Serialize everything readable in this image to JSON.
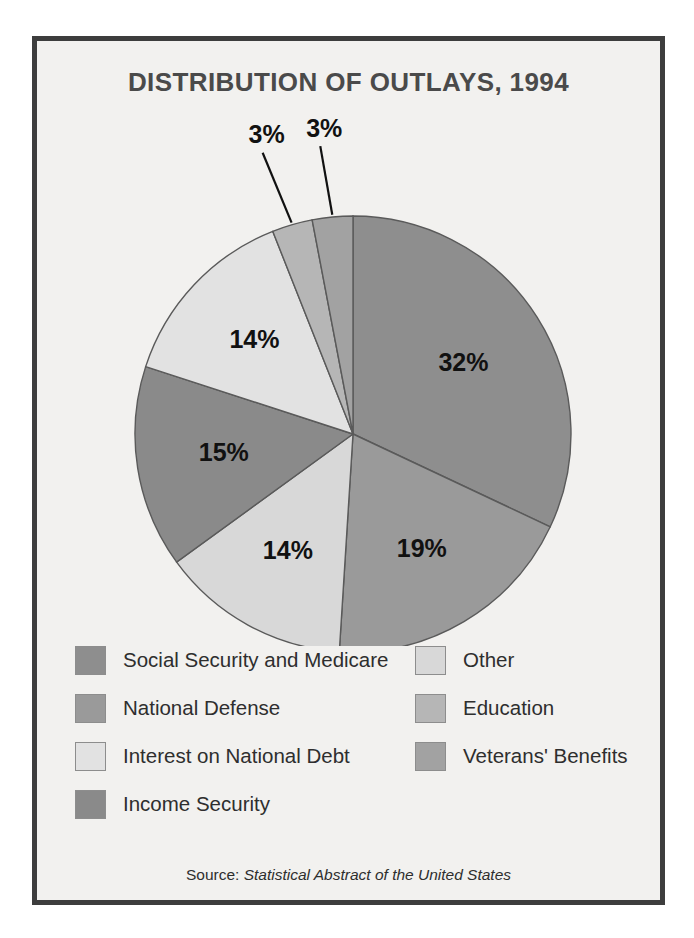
{
  "figure": {
    "title": "DISTRIBUTION OF OUTLAYS, 1994",
    "source_prefix": "Source:",
    "source_publication": "Statistical Abstract of the United States"
  },
  "chart_data": {
    "type": "pie",
    "title": "DISTRIBUTION OF OUTLAYS, 1994",
    "xlabel": "",
    "ylabel": "",
    "units": "percent",
    "total": 100,
    "start_angle_deg": 0,
    "direction": "clockwise",
    "legend_position": "bottom",
    "grid": false,
    "categories": [
      "Social Security and Medicare",
      "National Defense",
      "Other",
      "Income Security",
      "Interest on National Debt",
      "Education",
      "Veterans' Benefits"
    ],
    "values": [
      32,
      19,
      14,
      15,
      14,
      3,
      3
    ],
    "slices": [
      {
        "label": "Social Security and Medicare",
        "value": 32,
        "display": "32%",
        "color": "#8e8e8e",
        "label_radius_frac": 0.6,
        "leader": false
      },
      {
        "label": "National Defense",
        "value": 19,
        "display": "19%",
        "color": "#9a9a9a",
        "label_radius_frac": 0.62,
        "leader": false
      },
      {
        "label": "Other",
        "value": 14,
        "display": "14%",
        "color": "#d8d8d8",
        "label_radius_frac": 0.62,
        "leader": false
      },
      {
        "label": "Income Security",
        "value": 15,
        "display": "15%",
        "color": "#8a8a8a",
        "label_radius_frac": 0.6,
        "leader": false
      },
      {
        "label": "Interest on National Debt",
        "value": 14,
        "display": "14%",
        "color": "#e2e2e2",
        "label_radius_frac": 0.62,
        "leader": false
      },
      {
        "label": "Education",
        "value": 3,
        "display": "3%",
        "color": "#b6b6b6",
        "label_radius_frac": 1.42,
        "leader": true
      },
      {
        "label": "Veterans' Benefits",
        "value": 3,
        "display": "3%",
        "color": "#a2a2a2",
        "label_radius_frac": 1.4,
        "leader": true
      }
    ],
    "legend": {
      "columns": [
        {
          "items": [
            {
              "label": "Social Security and Medicare",
              "color": "#8e8e8e"
            },
            {
              "label": "National Defense",
              "color": "#9a9a9a"
            },
            {
              "label": "Interest on National Debt",
              "color": "#e2e2e2"
            },
            {
              "label": "Income Security",
              "color": "#8a8a8a"
            }
          ]
        },
        {
          "items": [
            {
              "label": "Other",
              "color": "#d8d8d8"
            },
            {
              "label": "Education",
              "color": "#b6b6b6"
            },
            {
              "label": "Veterans' Benefits",
              "color": "#a2a2a2"
            }
          ]
        }
      ]
    },
    "geometry": {
      "cx": 316,
      "cy": 333,
      "r": 218
    },
    "colors": {
      "outline": "#5a5a5a",
      "label_text": "#111111",
      "frame": "#3d3d3d",
      "panel_bg": "#f2f1ef"
    }
  }
}
